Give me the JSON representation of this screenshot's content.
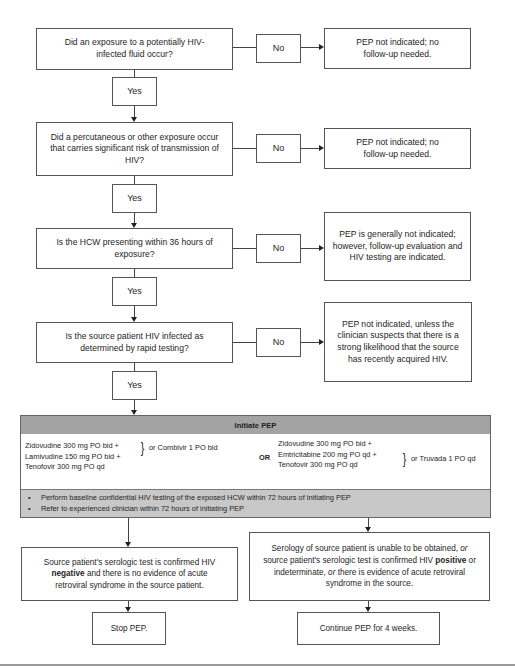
{
  "flowchart": {
    "decisions": [
      {
        "question": "Did an exposure to a potentially HIV-infected fluid occur?",
        "no_label": "No",
        "yes_label": "Yes",
        "no_outcome": "PEP not indicated; no follow-up needed."
      },
      {
        "question": "Did a percutaneous or other exposure occur that carries significant risk of transmission of HIV?",
        "no_label": "No",
        "yes_label": "Yes",
        "no_outcome": "PEP not indicated; no follow-up needed."
      },
      {
        "question": "Is the HCW presenting within 36 hours of exposure?",
        "no_label": "No",
        "yes_label": "Yes",
        "no_outcome": "PEP is generally not indicated; however, follow-up evaluation and HIV testing are indicated."
      },
      {
        "question": "Is the source patient HIV infected as determined by rapid testing?",
        "no_label": "No",
        "yes_label": "Yes",
        "no_outcome": "PEP not indicated, unless the clinician suspects that there is a strong likelihood that the source has recently acquired HIV."
      }
    ],
    "initiate_pep": {
      "title": "Initiate PEP",
      "regimen_a": {
        "lines": [
          "Zidovudine 300 mg PO bid +",
          "Lamivudine 150 mg PO bid +",
          "Tenofovir 300 mg PO qd"
        ],
        "alternative": "or Combivir 1 PO bid"
      },
      "or_label": "OR",
      "regimen_b": {
        "lines": [
          "Zidovudine 300 mg PO bid +",
          "Emtricitabine 200 mg PO qd +",
          "Tenofovir 300 mg PO qd"
        ],
        "alternative": "or Truvada 1 PO qd"
      },
      "notes": [
        "Perform baseline confidential HIV testing of the exposed HCW within 72 hours of initiating PEP",
        "Refer to experienced clinician within 72 hours of initiating PEP"
      ]
    },
    "branches": {
      "negative": {
        "text_before": "Source patient's serologic test is confirmed HIV ",
        "emphasis": "negative",
        "text_after": " and there is no evidence of acute retroviral syndrome in the source patient.",
        "outcome": "Stop PEP."
      },
      "positive": {
        "text_1": "Serology of source patient is unable to be obtained, ",
        "or_1": "or",
        "text_2": " source patient's serologic test is confirmed HIV ",
        "emphasis": "positive",
        "text_3": " or indeterminate, ",
        "or_2": "or",
        "text_4": " there is evidence of acute retroviral syndrome in the source.",
        "outcome": "Continue PEP for 4 weeks."
      }
    }
  },
  "colors": {
    "header_fill": "#a3a3a3",
    "notes_fill": "#c8c8c8",
    "border": "#555555"
  }
}
